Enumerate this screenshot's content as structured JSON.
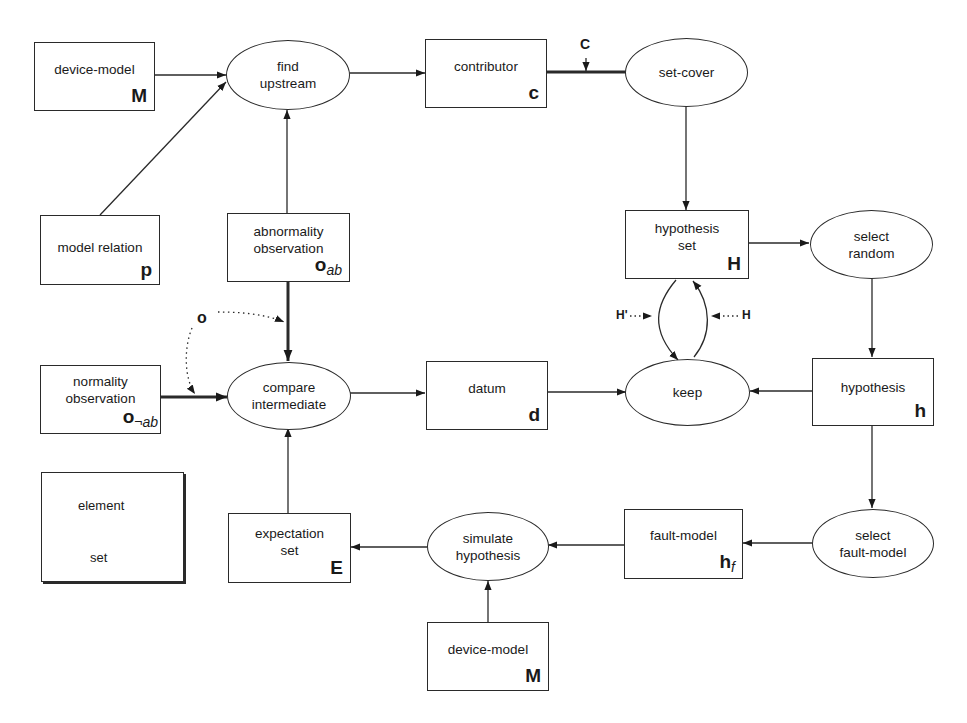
{
  "diagram": {
    "nodes": {
      "device_model_top": {
        "label": "device-model",
        "symbol": "M",
        "shape": "box"
      },
      "model_relation": {
        "label": "model relation",
        "symbol": "p",
        "shape": "box"
      },
      "find_upstream": {
        "label_line1": "find",
        "label_line2": "upstream",
        "shape": "ellipse"
      },
      "abnormality_observation": {
        "label_line1": "abnormality",
        "label_line2": "observation",
        "symbol": "o",
        "subscript": "ab",
        "shape": "box"
      },
      "contributor": {
        "label": "contributor",
        "symbol": "c",
        "shape": "box"
      },
      "set_cover": {
        "label": "set-cover",
        "shape": "ellipse"
      },
      "hypothesis_set": {
        "label_line1": "hypothesis",
        "label_line2": "set",
        "symbol": "H",
        "shape": "box"
      },
      "select_random": {
        "label_line1": "select",
        "label_line2": "random",
        "shape": "ellipse"
      },
      "normality_observation": {
        "label_line1": "normality",
        "label_line2": "observation",
        "symbol": "o",
        "subscript": "¬ab",
        "shape": "box"
      },
      "compare_intermediate": {
        "label_line1": "compare",
        "label_line2": "intermediate",
        "shape": "ellipse"
      },
      "datum": {
        "label": "datum",
        "symbol": "d",
        "shape": "box"
      },
      "keep": {
        "label": "keep",
        "shape": "ellipse"
      },
      "hypothesis": {
        "label": "hypothesis",
        "symbol": "h",
        "shape": "box"
      },
      "expectation_set": {
        "label_line1": "expectation",
        "label_line2": "set",
        "symbol": "E",
        "shape": "box"
      },
      "simulate_hypothesis": {
        "label_line1": "simulate",
        "label_line2": "hypothesis",
        "shape": "ellipse"
      },
      "fault_model": {
        "label": "fault-model",
        "symbol": "h",
        "subscript": "f",
        "shape": "box"
      },
      "select_fault_model": {
        "label_line1": "select",
        "label_line2": "fault-model",
        "shape": "ellipse"
      },
      "device_model_bottom": {
        "label": "device-model",
        "symbol": "M",
        "shape": "box"
      }
    },
    "edge_labels": {
      "c_to_setcover": "C",
      "o_dotted": "o",
      "h_prime": "H'",
      "h_in": "H"
    },
    "edges": [
      {
        "from": "device_model_top",
        "to": "find_upstream",
        "type": "element"
      },
      {
        "from": "model_relation",
        "to": "find_upstream",
        "type": "element"
      },
      {
        "from": "abnormality_observation",
        "to": "find_upstream",
        "type": "element"
      },
      {
        "from": "find_upstream",
        "to": "contributor",
        "type": "element"
      },
      {
        "from": "contributor",
        "to": "set_cover",
        "type": "set",
        "label": "C"
      },
      {
        "from": "set_cover",
        "to": "hypothesis_set",
        "type": "element"
      },
      {
        "from": "hypothesis_set",
        "to": "select_random",
        "type": "element"
      },
      {
        "from": "hypothesis_set",
        "to": "keep",
        "type": "element",
        "label": "H'"
      },
      {
        "from": "keep",
        "to": "hypothesis_set",
        "type": "element",
        "label": "H"
      },
      {
        "from": "select_random",
        "to": "hypothesis",
        "type": "element"
      },
      {
        "from": "hypothesis",
        "to": "keep",
        "type": "element"
      },
      {
        "from": "datum",
        "to": "keep",
        "type": "element"
      },
      {
        "from": "compare_intermediate",
        "to": "datum",
        "type": "element"
      },
      {
        "from": "abnormality_observation",
        "to": "compare_intermediate",
        "type": "set"
      },
      {
        "from": "normality_observation",
        "to": "compare_intermediate",
        "type": "set"
      },
      {
        "from": "hypothesis",
        "to": "select_fault_model",
        "type": "element"
      },
      {
        "from": "select_fault_model",
        "to": "fault_model",
        "type": "element"
      },
      {
        "from": "fault_model",
        "to": "simulate_hypothesis",
        "type": "element"
      },
      {
        "from": "device_model_bottom",
        "to": "simulate_hypothesis",
        "type": "element"
      },
      {
        "from": "simulate_hypothesis",
        "to": "expectation_set",
        "type": "element"
      },
      {
        "from": "expectation_set",
        "to": "compare_intermediate",
        "type": "element"
      }
    ],
    "legend": {
      "element_label": "element",
      "set_label": "set"
    }
  }
}
